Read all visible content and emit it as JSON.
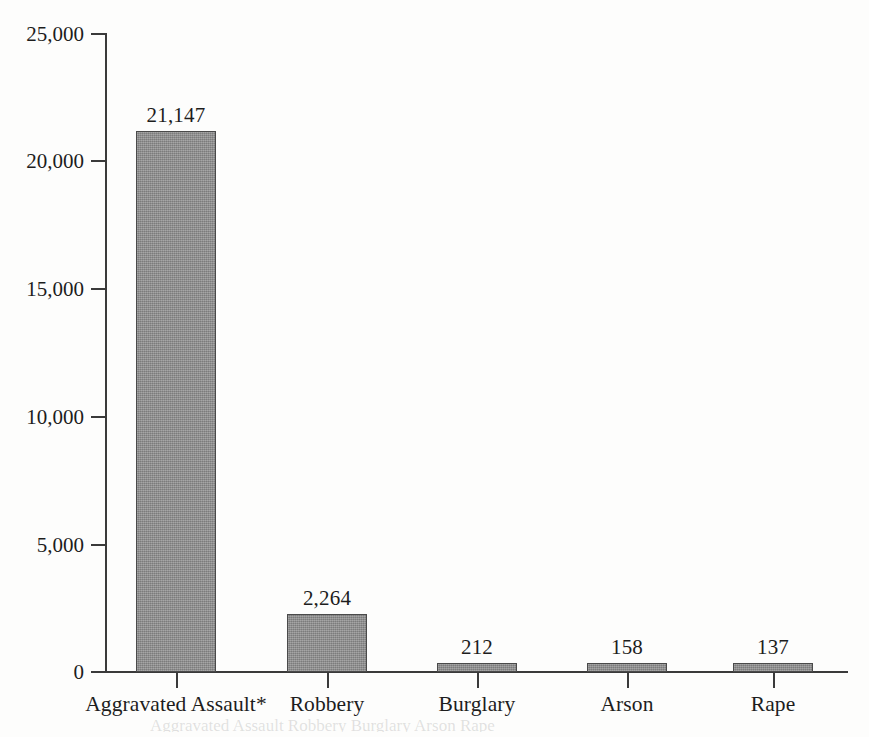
{
  "chart_data": {
    "type": "bar",
    "title": "",
    "subtitle": "",
    "xlabel": "",
    "ylabel": "",
    "categories": [
      "Aggravated Assault*",
      "Robbery",
      "Burglary",
      "Arson",
      "Rape"
    ],
    "values": [
      21147,
      2264,
      212,
      158,
      137
    ],
    "value_labels": [
      "21,147",
      "2,264",
      "212",
      "158",
      "137"
    ],
    "ylim": [
      0,
      25000
    ],
    "y_ticks": [
      0,
      5000,
      10000,
      15000,
      20000,
      25000
    ],
    "y_tick_labels": [
      "0",
      "5,000",
      "10,000",
      "15,000",
      "20,000",
      "25,000"
    ],
    "grid": false,
    "legend": false,
    "legend_position": "none",
    "bar_color": "#8d8d8d",
    "bar_border_color": "#4a4a4a",
    "axis_color": "#3a3a3a",
    "background_color": "#fdfdfc",
    "text_color": "#1d1d1d",
    "footnote_marker": "*"
  },
  "page": {
    "bleed_through_text": "Aggravated Assault  Robbery        Burglary      Arson          Rape"
  }
}
